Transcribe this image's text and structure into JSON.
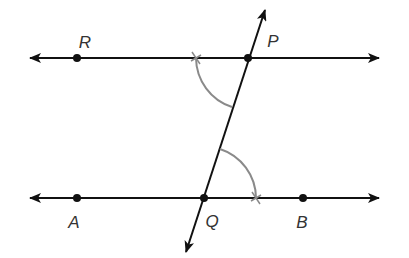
{
  "diagram": {
    "type": "geometry-construction",
    "colors": {
      "line": "#111111",
      "arc": "#8a8a8a",
      "label": "#333333",
      "background": "#ffffff"
    },
    "points": [
      {
        "id": "R",
        "label": "R",
        "x": 77,
        "y": 58,
        "label_x": 85,
        "label_y": 42
      },
      {
        "id": "P",
        "label": "P",
        "x": 248,
        "y": 58,
        "label_x": 273,
        "label_y": 41
      },
      {
        "id": "A",
        "label": "A",
        "x": 77,
        "y": 198,
        "label_x": 74,
        "label_y": 222
      },
      {
        "id": "Q",
        "label": "Q",
        "x": 204,
        "y": 198,
        "label_x": 212,
        "label_y": 221
      },
      {
        "id": "B",
        "label": "B",
        "x": 303,
        "y": 198,
        "label_x": 302,
        "label_y": 222
      }
    ],
    "lines": [
      {
        "id": "line-RP",
        "name": "top parallel line",
        "x1": 30,
        "y1": 58,
        "x2": 379,
        "y2": 58,
        "arrows": "both"
      },
      {
        "id": "line-AB",
        "name": "bottom parallel line",
        "x1": 30,
        "y1": 198,
        "x2": 379,
        "y2": 198,
        "arrows": "both"
      },
      {
        "id": "line-PQ",
        "name": "transversal",
        "x1": 186,
        "y1": 252,
        "x2": 265,
        "y2": 10,
        "arrows": "both"
      }
    ],
    "arcs": [
      {
        "id": "arc-P",
        "center": "P",
        "radius": 52,
        "from": [
          196,
          58
        ],
        "to": [
          232,
          107
        ]
      },
      {
        "id": "arc-Q",
        "center": "Q",
        "radius": 52,
        "from": [
          220,
          149
        ],
        "to": [
          256,
          198
        ]
      }
    ]
  }
}
